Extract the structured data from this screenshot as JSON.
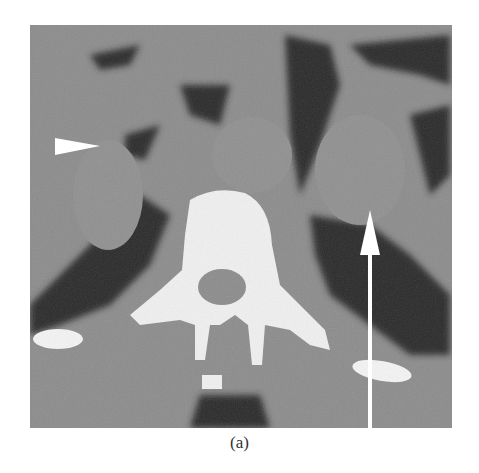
{
  "figure": {
    "caption": "(a)",
    "image_description": "Axial CT slice at the level of the adrenal glands showing vertebral body, spinal canal, ribs, paraspinal fat and bilateral adrenal masses",
    "annotations": [
      {
        "type": "arrowhead",
        "direction": "right",
        "color": "#ffffff",
        "label": "right-adrenal-marker"
      },
      {
        "type": "arrow",
        "direction": "up",
        "color": "#ffffff",
        "label": "left-adrenal-marker"
      }
    ],
    "colors": {
      "background": "#ffffff",
      "soft_tissue": "#8a8a8a",
      "fat": "#2a2a2a",
      "bone": "#f2f2f2"
    }
  }
}
